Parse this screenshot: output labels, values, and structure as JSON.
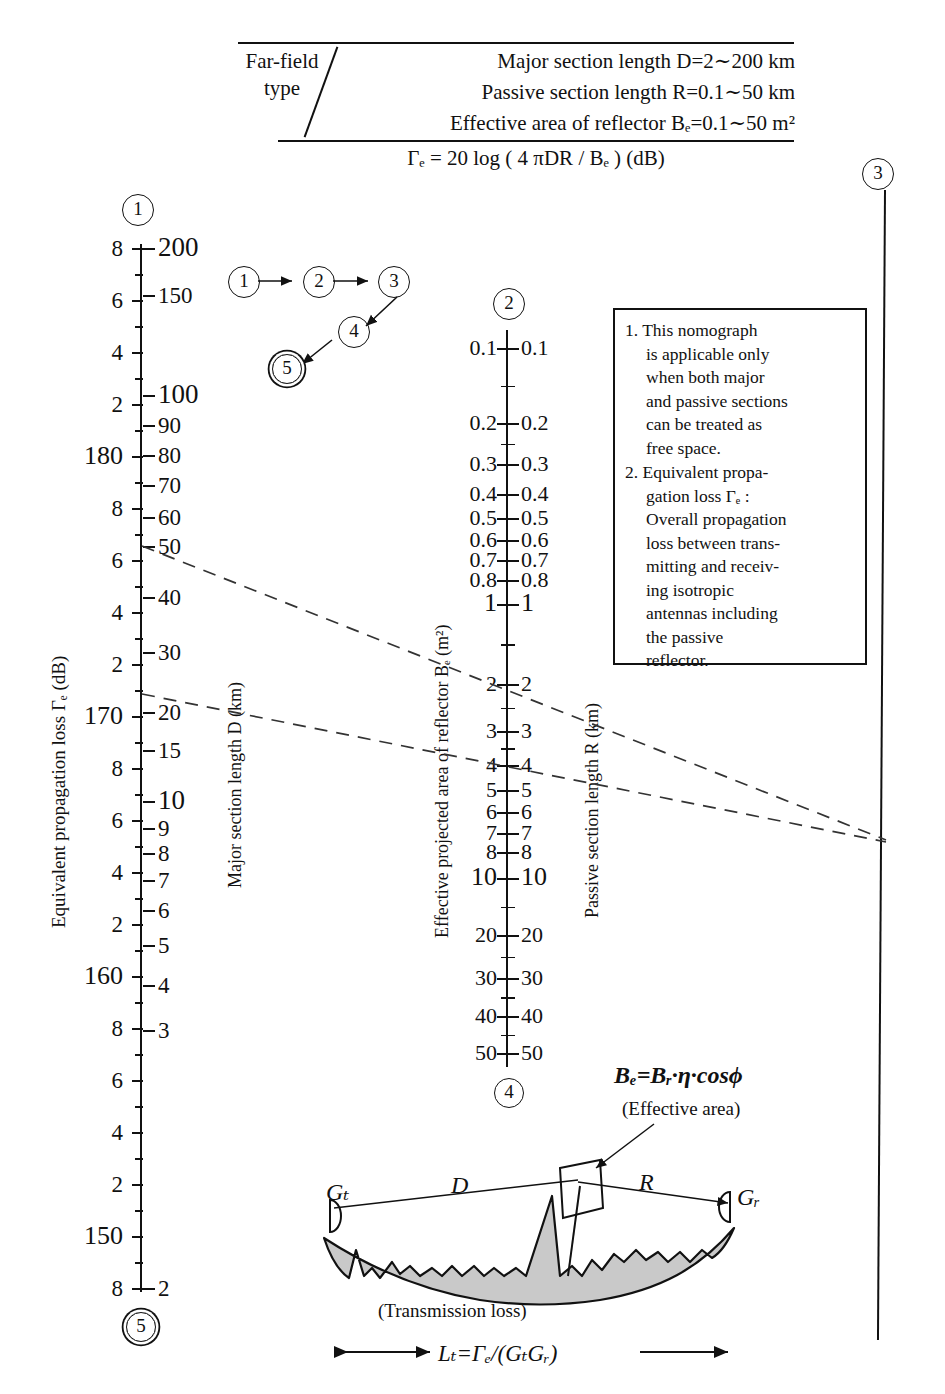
{
  "header": {
    "type_label_line1": "Far-field",
    "type_label_line2": "type",
    "spec_lines": [
      "Major section length  D=2∼200 km",
      "Passive section length  R=0.1∼50 km",
      "Effective area of reflector  Bₑ=0.1∼50 m²"
    ],
    "equation": "Γₑ = 20 log ( 4 πDR / Bₑ ) (dB)"
  },
  "axes": {
    "left": {
      "caption": "Equivalent propagation loss Γₑ (dB)",
      "inner_caption": "Major section length D (km)",
      "marker_top": "1",
      "marker_bottom": "5",
      "loss_labels": [
        "8",
        "6",
        "4",
        "2",
        "180",
        "8",
        "6",
        "4",
        "2",
        "170",
        "8",
        "6",
        "4",
        "2",
        "160",
        "8",
        "6",
        "4",
        "2",
        "150",
        "8"
      ],
      "distance_labels": [
        "200",
        "150",
        "",
        "100",
        "90",
        "80",
        "70",
        "60",
        "50",
        "40",
        "30",
        "20",
        "15",
        "10",
        "9",
        "8",
        "7",
        "6",
        "5",
        "4",
        "3",
        "",
        "2"
      ]
    },
    "middle": {
      "caption_left": "Effective projected area of reflector Bₑ (m²)",
      "caption_right": "Passive section length R (km)",
      "marker_top": "2",
      "marker_bottom": "4",
      "labels": [
        "0.1",
        "0.2",
        "0.3",
        "0.4",
        "0.5",
        "0.6",
        "0.7",
        "0.8",
        "1",
        "2",
        "3",
        "4",
        "5",
        "6",
        "7",
        "8",
        "10",
        "20",
        "30",
        "40",
        "50"
      ]
    },
    "right": {
      "marker_top": "3"
    }
  },
  "flow": {
    "steps": [
      "1",
      "2",
      "3",
      "4",
      "5"
    ]
  },
  "notes": {
    "items": [
      "1. This nomograph is applicable only when both major and passive sections can be treated as free space.",
      "2. Equivalent propagation loss Γₑ : Overall propagation loss between transmitting and receiving isotropic antennas including the passive reflector."
    ],
    "item1_lines": [
      "1. This nomograph",
      "is applicable only",
      "when both major",
      "and passive sections",
      "can be treated as",
      "free space."
    ],
    "item2_lines": [
      "2. Equivalent propa-",
      "gation loss Γₑ :",
      "Overall propagation",
      "loss between trans-",
      "mitting and receiv-",
      "ing isotropic",
      "antennas including",
      "the passive",
      "reflector."
    ]
  },
  "diagram": {
    "formula": "Bₑ=Bᵣ·η·cosϕ",
    "formula_sub": "(Effective area)",
    "gain_tx": "Gₜ",
    "gain_rx": "Gᵣ",
    "span_major": "D",
    "span_passive": "R",
    "ground_label": "(Transmission loss)",
    "bottom_formula": "Lₜ=Γₑ/(GₜGᵣ)"
  },
  "chart_data": {
    "type": "nomograph",
    "scales": [
      {
        "name": "Equivalent propagation loss",
        "symbol": "Γe",
        "unit": "dB",
        "ticks": [
          182,
          181.5,
          181,
          180.8,
          180.6,
          180.4,
          180.2,
          180,
          179.8,
          179.6,
          179.4,
          179.2,
          179,
          178.8,
          178.6,
          178.4,
          178.2,
          178,
          177.8,
          177.6,
          177.4,
          177.2
        ],
        "labeled": [
          "8",
          "6",
          "4",
          "2",
          "180",
          "8",
          "6",
          "4",
          "2",
          "170",
          "8",
          "6",
          "4",
          "2",
          "160",
          "8",
          "6",
          "4",
          "2",
          "150",
          "8"
        ]
      },
      {
        "name": "Major section length",
        "symbol": "D",
        "unit": "km",
        "labeled": [
          "200",
          "150",
          "100",
          "90",
          "80",
          "70",
          "60",
          "50",
          "40",
          "30",
          "20",
          "15",
          "10",
          "9",
          "8",
          "7",
          "6",
          "5",
          "4",
          "3",
          "2"
        ]
      },
      {
        "name": "Effective projected area of reflector",
        "symbol": "Be",
        "unit": "m^2",
        "labeled": [
          "0.1",
          "0.2",
          "0.3",
          "0.4",
          "0.5",
          "0.6",
          "0.7",
          "0.8",
          "1",
          "2",
          "3",
          "4",
          "5",
          "6",
          "7",
          "8",
          "10",
          "20",
          "30",
          "40",
          "50"
        ]
      },
      {
        "name": "Passive section length",
        "symbol": "R",
        "unit": "km",
        "labeled": [
          "0.1",
          "0.2",
          "0.3",
          "0.4",
          "0.5",
          "0.6",
          "0.7",
          "0.8",
          "1",
          "2",
          "3",
          "4",
          "5",
          "6",
          "7",
          "8",
          "10",
          "20",
          "30",
          "40",
          "50"
        ]
      }
    ],
    "construction_lines": [
      {
        "from": "left-axis D=50",
        "to": "pivot-right",
        "style": "dashed"
      },
      {
        "from": "left-axis loss=170",
        "to": "pivot-right",
        "style": "dashed"
      }
    ]
  }
}
